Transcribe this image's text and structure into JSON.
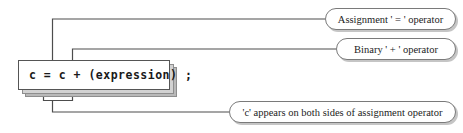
{
  "diagram": {
    "code": {
      "statement": "c = c + (expression) ;"
    },
    "callouts": [
      {
        "id": "assignment",
        "label": "Assignment ' = ' operator"
      },
      {
        "id": "binary",
        "label": "Binary ' + ' operator"
      },
      {
        "id": "both-sides",
        "label": "'c' appears on both sides of assignment operator"
      }
    ],
    "colors": {
      "background": "#ffffff",
      "line": "#4d4d4d",
      "box_border": "#555555",
      "shadow_light": "#d2d2d2",
      "shadow_dark": "#b9b9b9",
      "pill_border": "#7a7a7a",
      "text": "#1c1c1c"
    }
  }
}
